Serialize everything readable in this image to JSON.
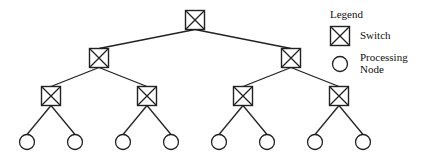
{
  "diagram": {
    "type": "binary-tree",
    "levels": [
      [
        {
          "x": 195,
          "y": 20,
          "kind": "switch"
        }
      ],
      [
        {
          "x": 99,
          "y": 58,
          "kind": "switch"
        },
        {
          "x": 291,
          "y": 58,
          "kind": "switch"
        }
      ],
      [
        {
          "x": 51,
          "y": 96,
          "kind": "switch"
        },
        {
          "x": 147,
          "y": 96,
          "kind": "switch"
        },
        {
          "x": 243,
          "y": 96,
          "kind": "switch"
        },
        {
          "x": 339,
          "y": 96,
          "kind": "switch"
        }
      ],
      [
        {
          "x": 27,
          "y": 142,
          "kind": "node"
        },
        {
          "x": 75,
          "y": 142,
          "kind": "node"
        },
        {
          "x": 123,
          "y": 142,
          "kind": "node"
        },
        {
          "x": 171,
          "y": 142,
          "kind": "node"
        },
        {
          "x": 219,
          "y": 142,
          "kind": "node"
        },
        {
          "x": 267,
          "y": 142,
          "kind": "node"
        },
        {
          "x": 315,
          "y": 142,
          "kind": "node"
        },
        {
          "x": 363,
          "y": 142,
          "kind": "node"
        }
      ]
    ]
  },
  "legend": {
    "title": "Legend",
    "items": [
      {
        "symbol": "switch",
        "label": "Switch"
      },
      {
        "symbol": "node",
        "label_line1": "Processing",
        "label_line2": "Node"
      }
    ]
  },
  "colors": {
    "stroke": "#222222",
    "background": "#ffffff"
  }
}
